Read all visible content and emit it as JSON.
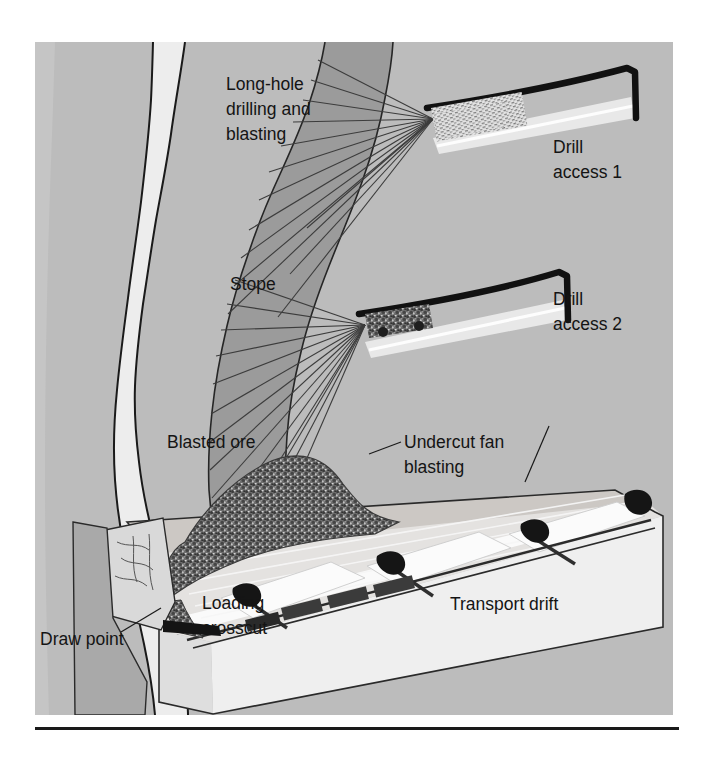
{
  "figure": {
    "title_caption": "",
    "labels": [
      {
        "id": "long-hole-drilling",
        "text_lines": [
          "Long-hole",
          "drilling and",
          "blasting"
        ],
        "x": 60,
        "y": 40,
        "anchor": "start"
      },
      {
        "id": "drill-access-1",
        "text_lines": [
          "Drill",
          "access 1"
        ],
        "x": 520,
        "y": 105,
        "anchor": "start"
      },
      {
        "id": "stope",
        "text_lines": [
          "Stope"
        ],
        "x": 195,
        "y": 238,
        "anchor": "start"
      },
      {
        "id": "drill-access-2",
        "text_lines": [
          "Drill",
          "access 2"
        ],
        "x": 520,
        "y": 262,
        "anchor": "start"
      },
      {
        "id": "blasted-ore",
        "text_lines": [
          "Blasted ore"
        ],
        "x": 132,
        "y": 400,
        "anchor": "start"
      },
      {
        "id": "undercut-fan-blasting",
        "text_lines": [
          "Undercut fan",
          "blasting"
        ],
        "x": 338,
        "y": 400,
        "anchor": "start"
      },
      {
        "id": "loading-crosscut",
        "text_lines": [
          "Loading",
          "crosscut"
        ],
        "x": 168,
        "y": 560,
        "anchor": "start"
      },
      {
        "id": "transport-drift",
        "text_lines": [
          "Transport drift"
        ],
        "x": 420,
        "y": 560,
        "anchor": "start"
      },
      {
        "id": "draw-point",
        "text_lines": [
          "Draw point"
        ],
        "x": 8,
        "y": 595,
        "anchor": "start"
      }
    ],
    "colors": {
      "hanging_wall_rock": "#b9b9b9",
      "footwall_rock": "#c8c8c8",
      "pale_rock": "#ededed",
      "ore_body": "#9a9a9a",
      "drift_floor": "#f4f4f4",
      "blasted_muck": "#6e6e6e",
      "outline": "#1a1a1a",
      "label_text": "#141414",
      "rule": "#1a1a1a",
      "background": "#ffffff"
    },
    "elements": [
      {
        "name": "hanging-wall-band",
        "kind": "rock-band"
      },
      {
        "name": "pale-rock-band",
        "kind": "rock-band"
      },
      {
        "name": "ore-body-vein",
        "kind": "ore-zone"
      },
      {
        "name": "footwall-band",
        "kind": "rock-band"
      },
      {
        "name": "fan-drill-pattern-upper",
        "kind": "blast-fan",
        "rays": 14
      },
      {
        "name": "fan-drill-pattern-lower",
        "kind": "blast-fan",
        "rays": 14
      },
      {
        "name": "drill-access-drift-1",
        "kind": "drift"
      },
      {
        "name": "drill-access-drift-2",
        "kind": "drift"
      },
      {
        "name": "longhole-drill-rig",
        "kind": "equipment"
      },
      {
        "name": "lhd-loader",
        "kind": "equipment"
      },
      {
        "name": "blasted-ore-pile",
        "kind": "muck-pile"
      },
      {
        "name": "transport-drift-block",
        "kind": "drift"
      },
      {
        "name": "loading-crosscut-1",
        "kind": "crosscut"
      },
      {
        "name": "loading-crosscut-2",
        "kind": "crosscut"
      },
      {
        "name": "loading-crosscut-3",
        "kind": "crosscut"
      },
      {
        "name": "ore-train",
        "kind": "equipment"
      },
      {
        "name": "draw-point-opening",
        "kind": "opening"
      },
      {
        "name": "undercut-leader-line",
        "kind": "leader"
      },
      {
        "name": "draw-point-leader-line",
        "kind": "leader"
      },
      {
        "name": "bottom-rule",
        "kind": "divider"
      }
    ]
  }
}
